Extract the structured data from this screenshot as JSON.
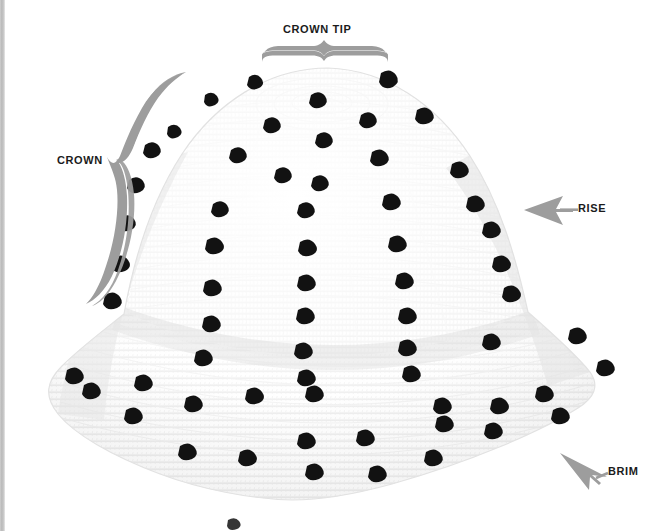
{
  "figure": {
    "background_color": "#ffffff",
    "yarn_color": "#fbfbfb",
    "bobble_color": "#111111",
    "annotation_color": "#9a9a9a",
    "label_color": "#1b1b1b",
    "page_edge_color": "#bfbfbf"
  },
  "annotations": {
    "crown_tip": {
      "label": "CROWN TIP",
      "marker": "brace-down",
      "points_to": "top of the crown"
    },
    "crown": {
      "label": "CROWN",
      "marker": "brace-right",
      "points_to": "upper dome of the hat"
    },
    "rise": {
      "label": "RISE",
      "marker": "arrow-left",
      "points_to": "side wall of the hat"
    },
    "brim": {
      "label": "BRIM",
      "marker": "arrow-upleft",
      "points_to": "outer edge of the hat"
    }
  }
}
